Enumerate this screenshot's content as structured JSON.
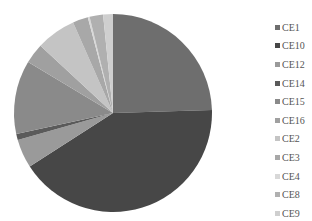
{
  "chart_data": {
    "type": "pie",
    "title": "",
    "start_angle": "12 o'clock, clockwise",
    "categories": [
      "CE1",
      "CE10",
      "CE12",
      "CE14",
      "CE15",
      "CE16",
      "CE2",
      "CE3",
      "CE4",
      "CE8",
      "CE9"
    ],
    "values": [
      24.5,
      41.4,
      4.7,
      1.0,
      12.0,
      3.3,
      6.5,
      2.5,
      0.3,
      2.2,
      1.6
    ],
    "colors": [
      "#6e6e6e",
      "#474747",
      "#9a9a9a",
      "#5a5a5a",
      "#8a8a8a",
      "#a0a0a0",
      "#c4c4c4",
      "#a8a8a8",
      "#d8d8d8",
      "#b0b0b0",
      "#cfcfcf"
    ],
    "legend_position": "right",
    "legend": [
      "CE1",
      "CE10",
      "CE12",
      "CE14",
      "CE15",
      "CE16",
      "CE2",
      "CE3",
      "CE4",
      "CE8",
      "CE9"
    ]
  }
}
